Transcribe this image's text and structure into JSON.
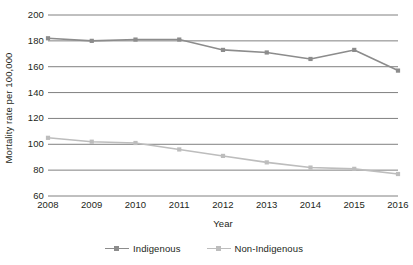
{
  "chart_data": {
    "type": "line",
    "title": "",
    "xlabel": "Year",
    "ylabel": "Mortality rate per 100,000",
    "categories": [
      "2008",
      "2009",
      "2010",
      "2011",
      "2012",
      "2013",
      "2014",
      "2015",
      "2016"
    ],
    "x": [
      2008,
      2009,
      2010,
      2011,
      2012,
      2013,
      2014,
      2015,
      2016
    ],
    "series": [
      {
        "name": "Indigenous",
        "color": "#8c8c8c",
        "values": [
          182,
          180,
          181,
          181,
          173,
          171,
          166,
          173,
          157
        ]
      },
      {
        "name": "Non-Indigenous",
        "color": "#bdbdbd",
        "values": [
          105,
          102,
          101,
          96,
          91,
          86,
          82,
          81,
          77
        ]
      }
    ],
    "ylim": [
      60,
      200
    ],
    "yticks": [
      60,
      80,
      100,
      120,
      140,
      160,
      180,
      200
    ],
    "xlim": [
      2008,
      2016
    ],
    "grid": "horizontal",
    "legend_position": "bottom"
  },
  "legend": {
    "entries": [
      {
        "label": "Indigenous"
      },
      {
        "label": "Non-Indigenous"
      }
    ]
  },
  "colors": {
    "indigenous": "#8c8c8c",
    "non_indigenous": "#bdbdbd",
    "gridline": "#808080",
    "text": "#231f20",
    "background": "#ffffff"
  }
}
